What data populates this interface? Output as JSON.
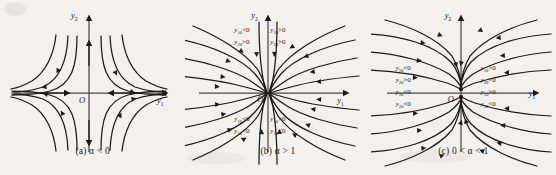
{
  "figure": {
    "type": "phase-portrait-triptych",
    "background_color": "#f2f1ee",
    "stroke_color": "#1c1a17",
    "panels": [
      {
        "id": "a",
        "caption": "(a)  α < 0",
        "caption_label": "(a)",
        "condition": "α < 0",
        "portrait_type": "saddle",
        "x_axis_label": "y",
        "x_axis_sub": "1",
        "y_axis_label": "y",
        "y_axis_sub": "2",
        "origin_label": "O",
        "quadrant_labels": [],
        "description": "Saddle point: trajectories approach along the y1 axis and depart along the y2 axis."
      },
      {
        "id": "b",
        "caption": "(b)  α > 1",
        "caption_label": "(b)",
        "condition": "α > 1",
        "portrait_type": "node-tangent-y1",
        "x_axis_label": "y",
        "x_axis_sub": "1",
        "y_axis_label": "y",
        "y_axis_sub": "2",
        "origin_label": "O",
        "quadrant_labels": [
          {
            "position": "top-left",
            "line1_var": "y",
            "line1_sub": "10",
            "line1_op": "<0",
            "line2_var": "y",
            "line2_sub": "20",
            "line2_op": ">0"
          },
          {
            "position": "top-right",
            "line1_var": "y",
            "line1_sub": "10",
            "line1_op": ">0",
            "line2_var": "y",
            "line2_sub": "20",
            "line2_op": ">0"
          },
          {
            "position": "bottom-left",
            "line1_var": "y",
            "line1_sub": "10",
            "line1_op": "<0",
            "line2_var": "y",
            "line2_sub": "20",
            "line2_op": "<0"
          },
          {
            "position": "bottom-right",
            "line1_var": "y",
            "line1_sub": "10",
            "line1_op": ">0",
            "line2_var": "y",
            "line2_sub": "20",
            "line2_op": "<0"
          }
        ],
        "description": "Improper node: all trajectories enter the origin tangent to the y1 axis."
      },
      {
        "id": "c",
        "caption": "(c) 0 < α < 1",
        "caption_label": "(c)",
        "condition": "0 < α < 1",
        "portrait_type": "node-tangent-y2",
        "x_axis_label": "y",
        "x_axis_sub": "1",
        "y_axis_label": "y",
        "y_axis_sub": "2",
        "origin_label": "O",
        "quadrant_labels": [
          {
            "position": "left-upper",
            "line1_var": "y",
            "line1_sub": "10",
            "line1_op": "<0",
            "line2_var": "y",
            "line2_sub": "20",
            "line2_op": ">0"
          },
          {
            "position": "left-lower",
            "line1_var": "y",
            "line1_sub": "10",
            "line1_op": "<0",
            "line2_var": "y",
            "line2_sub": "20",
            "line2_op": "<0"
          },
          {
            "position": "right-upper",
            "line1_var": "y",
            "line1_sub": "10",
            "line1_op": ">0",
            "line2_var": "y",
            "line2_sub": "20",
            "line2_op": ">0"
          },
          {
            "position": "right-lower",
            "line1_var": "y",
            "line1_sub": "10",
            "line1_op": ">0",
            "line2_var": "y",
            "line2_sub": "20",
            "line2_op": "<0"
          }
        ],
        "description": "Improper node: all trajectories enter the origin tangent to the y2 axis."
      }
    ]
  }
}
